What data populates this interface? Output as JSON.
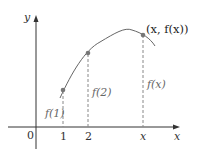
{
  "diagram": {
    "axes": {
      "x_label": "x",
      "y_label": "y",
      "origin_label": "0"
    },
    "ticks": {
      "one": "1",
      "two": "2",
      "x": "x"
    },
    "point_label": "(x, f(x))",
    "values": {
      "f1": "f(1)",
      "f2": "f(2)",
      "fx": "f(x)"
    },
    "colors": {
      "curve": "#555555",
      "point": "#777777",
      "axis": "#333333",
      "dash": "#888888"
    }
  }
}
